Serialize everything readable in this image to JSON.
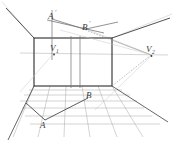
{
  "figure": {
    "canvas": {
      "width": 176,
      "height": 141,
      "background": "#ffffff"
    },
    "colors": {
      "primary_line": "#2b2b2b",
      "construction_line": "#8c8c8c",
      "grid_line": "#9a9a9a",
      "faint_line": "#b9b9b9",
      "label_text": "#3a3a3a"
    },
    "labels": {
      "a_prime": "A",
      "a_prime_mark": "'",
      "b_prime": "B",
      "b_prime_mark": "'",
      "v1": "V",
      "v1_sub": "1",
      "v2": "V",
      "v2_sub": "2",
      "a": "A",
      "b": "B"
    },
    "points": {
      "A_prime": {
        "x": 52,
        "y": 16
      },
      "B_prime": {
        "x": 86,
        "y": 27
      },
      "V1": {
        "x": 54,
        "y": 53
      },
      "V2": {
        "x": 152,
        "y": 55
      },
      "A": {
        "x": 44,
        "y": 123
      },
      "B": {
        "x": 89,
        "y": 100
      }
    },
    "back_wall": {
      "left": 34,
      "right": 112,
      "top": 38,
      "bottom": 86
    },
    "horizon_y": 53,
    "interior_verticals": [
      71,
      80
    ]
  }
}
